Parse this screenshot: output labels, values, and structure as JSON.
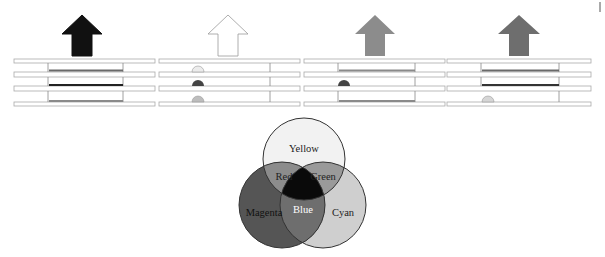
{
  "panels": [
    {
      "name": "panel-1",
      "arrow_color": "#111111",
      "x0": 14,
      "x1": 155,
      "wall_left": 48,
      "wall_right": 123,
      "compartments": [
        {
          "type": "bar",
          "color": "#6a6a6a"
        },
        {
          "type": "bar",
          "color": "#222222"
        },
        {
          "type": "bar",
          "color": "#8a8a8a"
        }
      ]
    },
    {
      "name": "panel-2",
      "arrow_color": "#ffffff",
      "x0": 159,
      "x1": 300,
      "wall_left": null,
      "wall_right": 270,
      "compartments": [
        {
          "type": "semicircle",
          "color": "#ececec"
        },
        {
          "type": "semicircle",
          "color": "#444444"
        },
        {
          "type": "semicircle",
          "color": "#bdbdbd"
        }
      ]
    },
    {
      "name": "panel-3",
      "arrow_color": "#8c8c8c",
      "x0": 304,
      "x1": 445,
      "wall_left": 338,
      "wall_right": 415,
      "compartments": [
        {
          "type": "bar",
          "color": "#8a8a8a"
        },
        {
          "type": "semicircle",
          "color": "#444444"
        },
        {
          "type": "bar",
          "color": "#8a8a8a"
        }
      ]
    },
    {
      "name": "panel-4",
      "arrow_color": "#6e6e6e",
      "x0": 447,
      "x1": 591,
      "wall_left": 481,
      "wall_right": 559,
      "compartments": [
        {
          "type": "bar",
          "color": "#6a6a6a"
        },
        {
          "type": "bar",
          "color": "#333333"
        },
        {
          "type": "semicircle",
          "color": "#d6d6d6"
        }
      ]
    }
  ],
  "venn": {
    "circles": [
      {
        "label": "Yellow",
        "color": "#f2f2f2"
      },
      {
        "label": "Magenta",
        "color": "#555555"
      },
      {
        "label": "Cyan",
        "color": "#cfcfcf"
      }
    ],
    "overlaps": [
      {
        "label": "Red",
        "color": "#8c8c8c"
      },
      {
        "label": "Green",
        "color": "#9a9a9a"
      },
      {
        "label": "Blue",
        "color": "#6e6e6e"
      }
    ],
    "center_color": "#0a0a0a"
  }
}
